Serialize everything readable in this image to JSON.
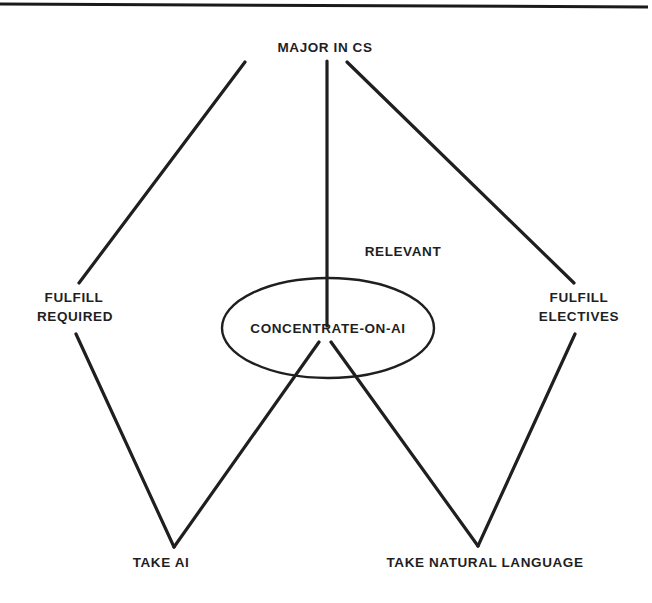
{
  "diagram": {
    "type": "goal-tree",
    "nodes": {
      "root": {
        "id": "major-in-cs",
        "label": "MAJOR IN CS"
      },
      "fulfill_required": {
        "id": "fulfill-required",
        "lines": [
          "FULFILL",
          "REQUIRED"
        ]
      },
      "concentrate": {
        "id": "concentrate-on-ai",
        "label": "CONCENTRATE-ON-AI",
        "highlighted": true,
        "annotation": "RELEVANT"
      },
      "fulfill_electives": {
        "id": "fulfill-electives",
        "lines": [
          "FULFILL",
          "ELECTIVES"
        ]
      },
      "take_ai": {
        "id": "take-ai",
        "label": "TAKE AI"
      },
      "take_nl": {
        "id": "take-natural-language",
        "label": "TAKE NATURAL LANGUAGE"
      }
    },
    "edges": [
      {
        "from": "major-in-cs",
        "to": "fulfill-required"
      },
      {
        "from": "major-in-cs",
        "to": "concentrate-on-ai"
      },
      {
        "from": "major-in-cs",
        "to": "fulfill-electives"
      },
      {
        "from": "fulfill-required",
        "to": "take-ai"
      },
      {
        "from": "concentrate-on-ai",
        "to": "take-ai"
      },
      {
        "from": "concentrate-on-ai",
        "to": "take-natural-language"
      },
      {
        "from": "fulfill-electives",
        "to": "take-natural-language"
      }
    ]
  }
}
